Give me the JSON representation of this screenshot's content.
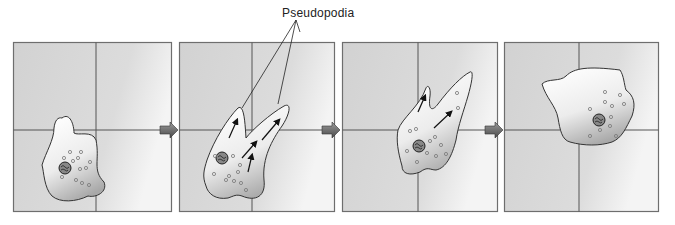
{
  "figure": {
    "label": "Pseudopodia",
    "panels": [
      {
        "id": 1,
        "description": "Amoeba at rest, rounded shape, lower-left quadrant"
      },
      {
        "id": 2,
        "description": "Two pseudopodia extending up-right with arrows showing cytoplasm flow"
      },
      {
        "id": 3,
        "description": "Cell body moving into the pseudopodia toward center"
      },
      {
        "id": 4,
        "description": "Amoeba has relocated to the upper-right quadrant"
      }
    ],
    "arrow_count": 3,
    "colors": {
      "panel_bg": "#d6d6d6",
      "panel_border": "#6e6e6e",
      "cell_fill_light": "#ffffff",
      "cell_fill_dark": "#a9a9a9",
      "outline": "#333333",
      "arrow_fill": "#6a6a6a"
    }
  }
}
